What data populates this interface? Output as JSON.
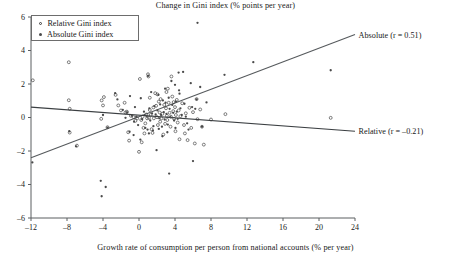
{
  "chart_data": {
    "type": "scatter",
    "title": "Change in Gini index (% points per year)",
    "xlabel": "Growth rate of consumption per person from national accounts (% per year)",
    "ylabel": "",
    "xlim": [
      -12,
      24
    ],
    "ylim": [
      -6,
      6
    ],
    "xticks": [
      -12,
      -8,
      -4,
      0,
      4,
      8,
      12,
      16,
      20,
      24
    ],
    "xtick_labels": [
      "–12",
      "–8",
      "–4",
      "0",
      "4",
      "8",
      "12",
      "16",
      "20",
      "24"
    ],
    "yticks": [
      -6,
      -4,
      -2,
      0,
      2,
      4,
      6
    ],
    "ytick_labels": [
      "–6",
      "–4",
      "–2",
      "0",
      "2",
      "4",
      "6"
    ],
    "grid": false,
    "legend_position": "top-left",
    "legend": [
      {
        "label": "Relative Gini index",
        "marker": "open-circle",
        "color": "#3a3a3a"
      },
      {
        "label": "Absolute Gini index",
        "marker": "filled-circle",
        "color": "#4a4a4a"
      }
    ],
    "annotations": [
      {
        "text": "Absolute (r = 0.51)",
        "x": 24.4,
        "y": 4.9,
        "anchor": "start"
      },
      {
        "text": "Relative (r = –0.21)",
        "x": 24.4,
        "y": -0.82,
        "anchor": "start"
      }
    ],
    "trendlines": [
      {
        "name": "Absolute",
        "r": 0.51,
        "color": "#55595c",
        "x0": -12,
        "y0": -2.4,
        "x1": 24,
        "y1": 4.95
      },
      {
        "name": "Relative",
        "r": -0.21,
        "color": "#3b3f42",
        "x0": -12,
        "y0": 0.62,
        "x1": 24,
        "y1": -0.82
      }
    ],
    "series": [
      {
        "name": "Relative Gini index",
        "marker": "open-circle",
        "color": "#3a3a3a",
        "points": [
          [
            -11.8,
            2.22
          ],
          [
            -7.8,
            3.3
          ],
          [
            -7.8,
            1.03
          ],
          [
            -7.7,
            0.52
          ],
          [
            -6.9,
            -1.68
          ],
          [
            -7.7,
            -0.9
          ],
          [
            -4.2,
            -0.08
          ],
          [
            -4.15,
            1.02
          ],
          [
            -3.9,
            1.22
          ],
          [
            -3.5,
            -0.58
          ],
          [
            -2.6,
            1.35
          ],
          [
            -2.3,
            0.72
          ],
          [
            -1.6,
            0.88
          ],
          [
            -1.5,
            0.3
          ],
          [
            -1.35,
            0.35
          ],
          [
            -1.2,
            -0.88
          ],
          [
            -1.1,
            -1.38
          ],
          [
            -0.9,
            0.1
          ],
          [
            -0.6,
            0.02
          ],
          [
            -0.4,
            -0.2
          ],
          [
            -0.2,
            -0.05
          ],
          [
            0.0,
            -2.05
          ],
          [
            0.1,
            2.3
          ],
          [
            0.25,
            -0.15
          ],
          [
            0.4,
            0.05
          ],
          [
            0.5,
            -0.62
          ],
          [
            0.6,
            -0.95
          ],
          [
            0.7,
            -0.35
          ],
          [
            0.8,
            0.18
          ],
          [
            0.9,
            -0.05
          ],
          [
            1.0,
            2.58
          ],
          [
            1.05,
            2.45
          ],
          [
            1.1,
            -0.02
          ],
          [
            1.2,
            0.45
          ],
          [
            1.3,
            0.15
          ],
          [
            1.4,
            -0.7
          ],
          [
            1.5,
            -0.92
          ],
          [
            1.6,
            0.6
          ],
          [
            1.65,
            -0.05
          ],
          [
            1.8,
            1.45
          ],
          [
            1.9,
            0.7
          ],
          [
            2.0,
            0.02
          ],
          [
            2.1,
            -0.45
          ],
          [
            2.2,
            0.95
          ],
          [
            2.3,
            0.3
          ],
          [
            2.35,
            -0.25
          ],
          [
            2.4,
            1.1
          ],
          [
            2.5,
            -0.05
          ],
          [
            2.6,
            0.22
          ],
          [
            2.7,
            -1.02
          ],
          [
            2.8,
            0.75
          ],
          [
            2.9,
            -0.38
          ],
          [
            3.0,
            0.55
          ],
          [
            3.1,
            0.1
          ],
          [
            3.15,
            -0.15
          ],
          [
            3.2,
            1.72
          ],
          [
            3.3,
            0.88
          ],
          [
            3.4,
            0.28
          ],
          [
            3.5,
            -0.55
          ],
          [
            3.55,
            0.05
          ],
          [
            3.6,
            2.45
          ],
          [
            3.7,
            1.25
          ],
          [
            3.8,
            0.38
          ],
          [
            3.9,
            -0.08
          ],
          [
            4.0,
            0.62
          ],
          [
            4.05,
            -0.82
          ],
          [
            4.1,
            0.15
          ],
          [
            4.2,
            1.05
          ],
          [
            4.3,
            -0.3
          ],
          [
            4.4,
            0.42
          ],
          [
            4.5,
            -1.3
          ],
          [
            4.6,
            0.08
          ],
          [
            4.8,
            0.85
          ],
          [
            5.0,
            -0.45
          ],
          [
            5.2,
            0.25
          ],
          [
            5.4,
            -1.35
          ],
          [
            5.6,
            0.58
          ],
          [
            5.8,
            -0.62
          ],
          [
            6.0,
            0.32
          ],
          [
            6.2,
            -1.55
          ],
          [
            6.4,
            1.1
          ],
          [
            6.5,
            -0.1
          ],
          [
            6.8,
            0.48
          ],
          [
            7.0,
            -0.55
          ],
          [
            7.2,
            -1.62
          ],
          [
            8.0,
            -0.12
          ],
          [
            9.6,
            0.2
          ],
          [
            21.3,
            -0.02
          ],
          [
            -4.0,
            0.72
          ],
          [
            -2.0,
            0.42
          ],
          [
            1.2,
            1.18
          ],
          [
            2.05,
            1.38
          ],
          [
            3.05,
            1.52
          ],
          [
            0.3,
            -1.48
          ],
          [
            5.1,
            -0.95
          ],
          [
            3.85,
            0.92
          ]
        ]
      },
      {
        "name": "Absolute Gini index",
        "marker": "filled-circle",
        "color": "#4a4a4a",
        "points": [
          [
            -11.85,
            -2.68
          ],
          [
            -7.75,
            -0.82
          ],
          [
            -7.0,
            -1.72
          ],
          [
            -4.25,
            -3.78
          ],
          [
            -4.15,
            -4.7
          ],
          [
            -3.7,
            -4.15
          ],
          [
            -3.5,
            -0.6
          ],
          [
            -2.65,
            1.45
          ],
          [
            -2.4,
            1.08
          ],
          [
            -1.8,
            0.45
          ],
          [
            -1.5,
            -0.02
          ],
          [
            -1.3,
            0.3
          ],
          [
            -1.05,
            -0.85
          ],
          [
            -0.8,
            0.12
          ],
          [
            -0.55,
            -0.25
          ],
          [
            -0.3,
            0.05
          ],
          [
            -0.1,
            -0.45
          ],
          [
            0.2,
            1.15
          ],
          [
            0.35,
            -0.1
          ],
          [
            0.55,
            0.35
          ],
          [
            0.7,
            -0.62
          ],
          [
            0.85,
            0.08
          ],
          [
            1.0,
            2.48
          ],
          [
            1.15,
            0.55
          ],
          [
            1.25,
            -0.18
          ],
          [
            1.35,
            1.52
          ],
          [
            1.45,
            0.25
          ],
          [
            1.55,
            -0.78
          ],
          [
            1.7,
            0.68
          ],
          [
            1.85,
            0.18
          ],
          [
            1.95,
            -1.95
          ],
          [
            2.05,
            0.42
          ],
          [
            2.15,
            1.35
          ],
          [
            2.25,
            -0.05
          ],
          [
            2.35,
            0.78
          ],
          [
            2.45,
            0.15
          ],
          [
            2.55,
            -0.55
          ],
          [
            2.65,
            1.02
          ],
          [
            2.75,
            0.32
          ],
          [
            2.85,
            -0.12
          ],
          [
            2.95,
            0.88
          ],
          [
            3.05,
            0.22
          ],
          [
            3.2,
            -0.42
          ],
          [
            3.3,
            1.18
          ],
          [
            3.4,
            0.52
          ],
          [
            3.5,
            0.02
          ],
          [
            3.6,
            2.18
          ],
          [
            3.7,
            0.75
          ],
          [
            3.8,
            0.28
          ],
          [
            3.9,
            -0.18
          ],
          [
            4.0,
            1.95
          ],
          [
            4.1,
            0.95
          ],
          [
            4.2,
            0.35
          ],
          [
            4.3,
            -0.08
          ],
          [
            4.4,
            2.68
          ],
          [
            4.5,
            1.42
          ],
          [
            4.6,
            0.55
          ],
          [
            4.75,
            0.15
          ],
          [
            4.9,
            2.72
          ],
          [
            5.05,
            0.82
          ],
          [
            5.2,
            0.05
          ],
          [
            5.5,
            -0.72
          ],
          [
            5.75,
            2.05
          ],
          [
            5.9,
            0.62
          ],
          [
            6.0,
            -2.6
          ],
          [
            6.25,
            0.52
          ],
          [
            6.4,
            1.08
          ],
          [
            6.5,
            5.65
          ],
          [
            6.8,
            1.82
          ],
          [
            7.0,
            -0.55
          ],
          [
            7.5,
            0.9
          ],
          [
            9.5,
            2.55
          ],
          [
            12.7,
            3.3
          ],
          [
            21.3,
            2.82
          ],
          [
            3.35,
            -3.35
          ],
          [
            0.15,
            -1.32
          ],
          [
            2.6,
            -1.12
          ],
          [
            -0.6,
            -1.05
          ],
          [
            1.1,
            -0.95
          ],
          [
            3.15,
            -0.88
          ],
          [
            0.95,
            -0.72
          ],
          [
            2.2,
            -0.68
          ],
          [
            4.05,
            -0.62
          ],
          [
            1.6,
            -0.52
          ],
          [
            5.35,
            -0.35
          ],
          [
            -4.0,
            0.15
          ],
          [
            -1.0,
            1.28
          ],
          [
            -0.45,
            0.62
          ],
          [
            2.9,
            1.72
          ],
          [
            4.45,
            1.62
          ]
        ]
      }
    ]
  },
  "axes_geometry": {
    "plot_left_px": 31,
    "plot_right_px": 355,
    "plot_top_px": 17,
    "plot_bottom_px": 218
  }
}
